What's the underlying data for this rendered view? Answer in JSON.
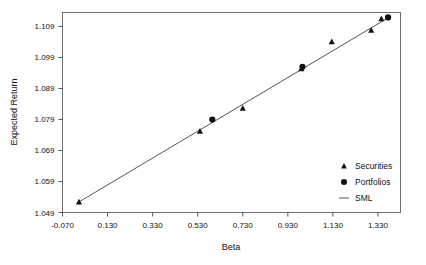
{
  "chart_data": {
    "type": "scatter",
    "title": "",
    "xlabel": "Beta",
    "ylabel": "Expected Return",
    "xlim": [
      -0.07,
      1.43
    ],
    "ylim": [
      1.049,
      1.1135
    ],
    "grid": false,
    "legend_position": "bottom-right",
    "xticks": [
      "-0.070",
      "0.130",
      "0.330",
      "0.530",
      "0.730",
      "0.930",
      "1.130",
      "1.330"
    ],
    "xtick_values": [
      -0.07,
      0.13,
      0.33,
      0.53,
      0.73,
      0.93,
      1.13,
      1.33
    ],
    "yticks": [
      "1.049",
      "1.059",
      "1.069",
      "1.079",
      "1.089",
      "1.099",
      "1.109"
    ],
    "ytick_values": [
      1.049,
      1.059,
      1.069,
      1.079,
      1.089,
      1.099,
      1.109
    ],
    "series": [
      {
        "name": "Securities",
        "marker": "triangle",
        "color": "#111111",
        "points": [
          {
            "x": 0.003,
            "y": 1.0524
          },
          {
            "x": 0.54,
            "y": 1.0752
          },
          {
            "x": 0.73,
            "y": 1.0826
          },
          {
            "x": 0.99,
            "y": 1.0954
          },
          {
            "x": 1.125,
            "y": 1.1041
          },
          {
            "x": 1.3,
            "y": 1.1078
          },
          {
            "x": 1.345,
            "y": 1.1115
          }
        ]
      },
      {
        "name": "Portfolios",
        "marker": "circle",
        "color": "#111111",
        "points": [
          {
            "x": 0.595,
            "y": 1.079
          },
          {
            "x": 0.995,
            "y": 1.096
          },
          {
            "x": 1.375,
            "y": 1.1119
          }
        ]
      },
      {
        "name": "SML",
        "marker": "line",
        "color": "#555555",
        "points": [
          {
            "x": 0.003,
            "y": 1.0524
          },
          {
            "x": 1.38,
            "y": 1.112
          }
        ]
      }
    ]
  },
  "legend": {
    "items": [
      {
        "label": "Securities",
        "marker": "triangle"
      },
      {
        "label": "Portfolios",
        "marker": "circle"
      },
      {
        "label": "SML",
        "marker": "line"
      }
    ]
  }
}
